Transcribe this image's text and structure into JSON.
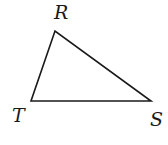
{
  "diagram": {
    "type": "triangle",
    "stroke_color": "#1a1a1a",
    "fill": "none",
    "vertices": [
      {
        "name": "R",
        "x": 55,
        "y": 31
      },
      {
        "name": "T",
        "x": 31,
        "y": 101
      },
      {
        "name": "S",
        "x": 151,
        "y": 101
      }
    ],
    "labels": {
      "r": "R",
      "t": "T",
      "s": "S"
    }
  }
}
